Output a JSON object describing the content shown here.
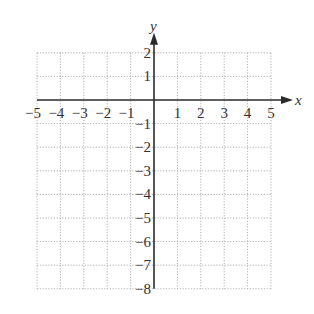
{
  "chart_data": {
    "type": "coordinate-grid",
    "title": "",
    "xlabel": "x",
    "ylabel": "y",
    "xlim": [
      -5,
      5
    ],
    "ylim": [
      -8,
      2
    ],
    "grid": true,
    "grid_style": "dotted",
    "x_ticks": [
      -5,
      -4,
      -3,
      -2,
      -1,
      1,
      2,
      3,
      4,
      5
    ],
    "y_ticks": [
      2,
      1,
      -1,
      -2,
      -3,
      -4,
      -5,
      -6,
      -7,
      -8
    ],
    "x_tick_labels": [
      "−5",
      "−4",
      "−3",
      "−2",
      "−1",
      "1",
      "2",
      "3",
      "4",
      "5"
    ],
    "y_tick_labels": [
      "2",
      "1",
      "−1",
      "−2",
      "−3",
      "−4",
      "−5",
      "−6",
      "−7",
      "−8"
    ],
    "series": [],
    "axis_arrows": [
      "x-positive",
      "y-positive"
    ]
  },
  "colors": {
    "axis": "#2a2a2a",
    "grid": "#b0b0b0",
    "text": "#333333",
    "background": "#ffffff"
  }
}
